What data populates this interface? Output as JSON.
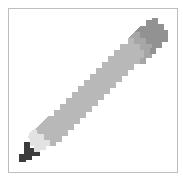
{
  "icon": {
    "name": "pencil",
    "colors": {
      "eraser": "#929292",
      "ferrule": "#a6a6a6",
      "body": "#b8b8b8",
      "wood": "#e2e2e2",
      "lead": "#3c3c3c",
      "border": "#bdbdbd"
    }
  }
}
